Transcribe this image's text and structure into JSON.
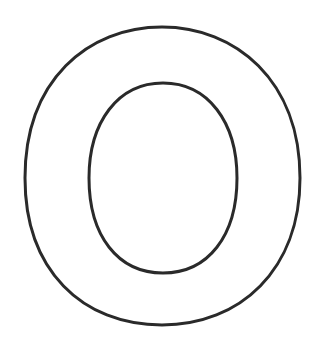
{
  "image": {
    "title": "Letter O outline",
    "letter": "O",
    "style": "outline coloring-page letter",
    "colors": {
      "background": "#ffffff",
      "stroke": "#2a2a2a"
    }
  }
}
